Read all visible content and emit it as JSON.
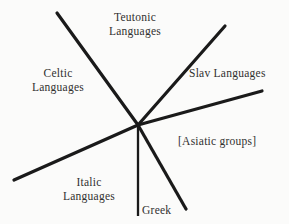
{
  "diagram": {
    "background_color": "#fbfbfa",
    "line_color": "#1a1a1a",
    "text_color": "#31302f",
    "center": {
      "x": 138,
      "y": 125
    },
    "branches": [
      {
        "id": "teutonic",
        "label_lines": [
          "Teutonic",
          "Languages"
        ],
        "direction": "upper-left",
        "from": {
          "x": 57,
          "y": 13
        },
        "to": {
          "x": 138,
          "y": 125
        },
        "stroke_width": 3
      },
      {
        "id": "celtic",
        "label_lines": [
          "Celtic",
          "Languages"
        ],
        "direction": "left",
        "shares_line_with": "teutonic"
      },
      {
        "id": "slav",
        "label_lines": [
          "Slav Languages"
        ],
        "direction": "upper-right",
        "from": {
          "x": 225,
          "y": 26
        },
        "to": {
          "x": 138,
          "y": 125
        },
        "stroke_width": 3
      },
      {
        "id": "asiatic",
        "label_lines": [
          "[Asiatic groups]"
        ],
        "direction": "right",
        "from": {
          "x": 138,
          "y": 125
        },
        "to": {
          "x": 262,
          "y": 91
        },
        "stroke_width": 3
      },
      {
        "id": "italic",
        "label_lines": [
          "Italic",
          "Languages"
        ],
        "direction": "lower-left",
        "from": {
          "x": 14,
          "y": 180
        },
        "to": {
          "x": 138,
          "y": 125
        },
        "stroke_width": 3
      },
      {
        "id": "greek",
        "label_lines": [
          "Greek"
        ],
        "direction": "down",
        "from": {
          "x": 138,
          "y": 125
        },
        "to": {
          "x": 138,
          "y": 216
        },
        "stroke_width": 2
      },
      {
        "id": "lower-right-branch",
        "label_lines": [],
        "direction": "lower-right",
        "from": {
          "x": 138,
          "y": 125
        },
        "to": {
          "x": 186,
          "y": 209
        },
        "stroke_width": 3
      }
    ]
  },
  "labels": {
    "teutonic": {
      "line1": "Teutonic",
      "line2": "Languages"
    },
    "celtic": {
      "line1": "Celtic",
      "line2": "Languages"
    },
    "slav": {
      "line1": "Slav Languages"
    },
    "asiatic": {
      "line1": "[Asiatic groups]"
    },
    "italic": {
      "line1": "Italic",
      "line2": "Languages"
    },
    "greek": {
      "line1": "Greek"
    }
  }
}
